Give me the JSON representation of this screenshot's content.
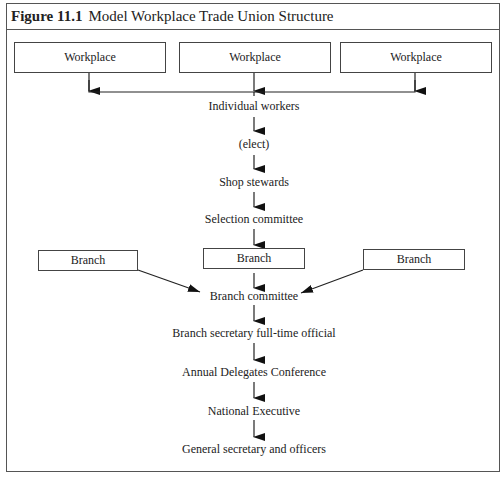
{
  "figure": {
    "number_label": "Figure 11.1",
    "title": "Model Workplace Trade Union Structure"
  },
  "workplaces": [
    {
      "label": "Workplace"
    },
    {
      "label": "Workplace"
    },
    {
      "label": "Workplace"
    }
  ],
  "chain_top": [
    {
      "label": "Individual workers"
    },
    {
      "label": "(elect)"
    },
    {
      "label": "Shop stewards"
    },
    {
      "label": "Selection committee"
    }
  ],
  "branches": [
    {
      "label": "Branch"
    },
    {
      "label": "Branch"
    },
    {
      "label": "Branch"
    }
  ],
  "chain_bottom": [
    {
      "label": "Branch committee"
    },
    {
      "label": "Branch secretary full-time official"
    },
    {
      "label": "Annual Delegates Conference"
    },
    {
      "label": "National Executive"
    },
    {
      "label": "General secretary and officers"
    }
  ],
  "colors": {
    "line": "#222222",
    "border": "#555555",
    "background": "#ffffff"
  }
}
